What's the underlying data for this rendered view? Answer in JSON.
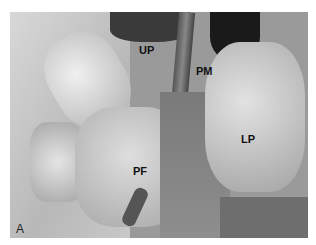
{
  "figure": {
    "panel_label": "A",
    "labels": [
      {
        "text": "UP",
        "x": 139,
        "y": 44
      },
      {
        "text": "PM",
        "x": 196,
        "y": 65
      },
      {
        "text": "LP",
        "x": 241,
        "y": 133
      },
      {
        "text": "PF",
        "x": 133,
        "y": 165
      }
    ]
  }
}
